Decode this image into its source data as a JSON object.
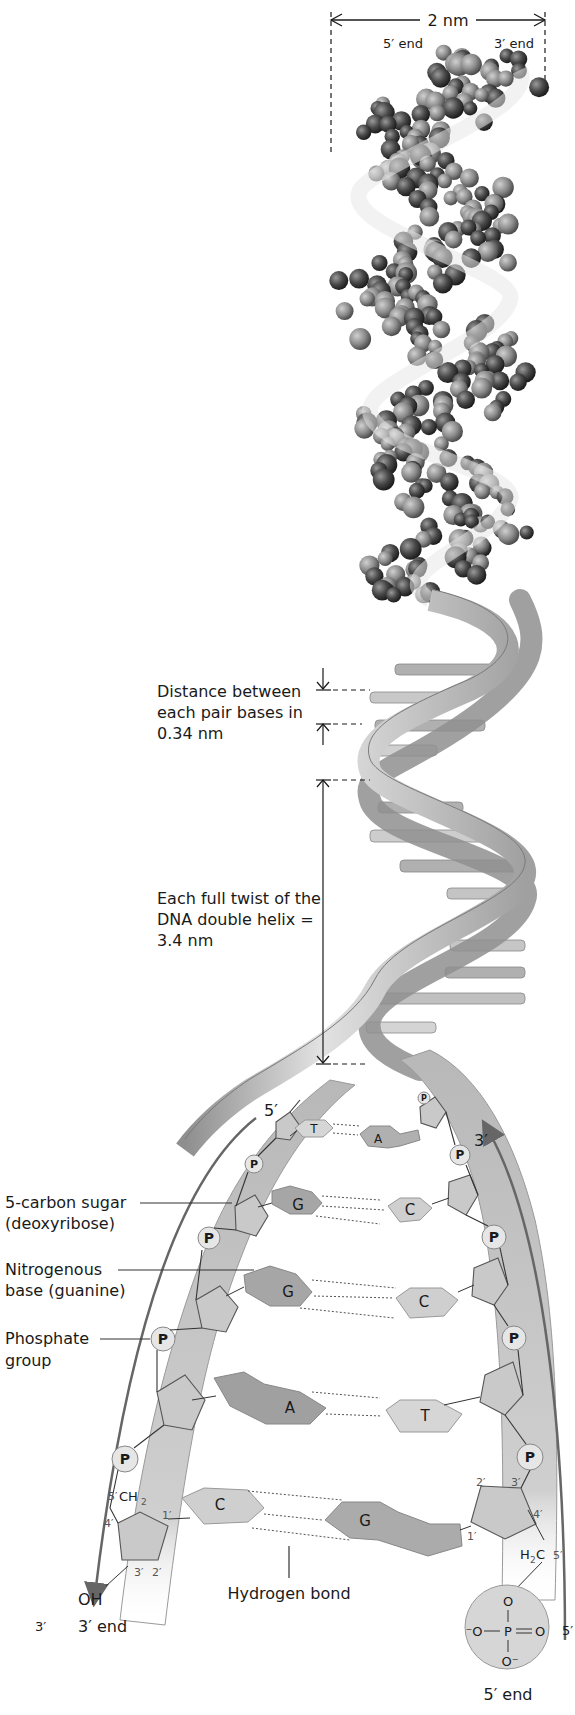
{
  "figure": {
    "width_label": "2 nm",
    "top_left_end": "5′ end",
    "top_right_end": "3′ end",
    "base_spacing": {
      "line1": "Distance between",
      "line2": "each pair bases in",
      "line3": "0.34 nm"
    },
    "full_twist": {
      "line1": "Each full twist of the",
      "line2": "DNA double helix =",
      "line3": "3.4 nm"
    },
    "strand_labels": {
      "left_top": "5′",
      "right_top": "3′",
      "left_bottom": "3′",
      "right_bottom": "5′",
      "left_end": "3′ end",
      "right_end": "5′ end"
    },
    "callouts": {
      "sugar_line1": "5-carbon sugar",
      "sugar_line2": "(deoxyribose)",
      "base_line1": "Nitrogenous",
      "base_line2": "base (guanine)",
      "phosphate_line1": "Phosphate",
      "phosphate_line2": "group",
      "hydrogen_bond": "Hydrogen bond"
    },
    "base_pairs": [
      {
        "left": "T",
        "right": "A"
      },
      {
        "left": "G",
        "right": "C"
      },
      {
        "left": "G",
        "right": "C"
      },
      {
        "left": "A",
        "right": "T"
      },
      {
        "left": "C",
        "right": "G"
      }
    ],
    "phosphate_symbol": "P",
    "chem": {
      "left_ch2": "CH",
      "left_ch2_sub": "2",
      "left_oh": "OH",
      "right_h2c_h": "H",
      "right_h2c_sub": "2",
      "right_h2c_c": "C",
      "primes": {
        "one": "1′",
        "two": "2′",
        "three": "3′",
        "four": "4′",
        "five": "5′"
      },
      "phosphate_O_top": "O",
      "phosphate_O_left": "⁻O",
      "phosphate_P": "P",
      "phosphate_O_right": "O",
      "phosphate_O_bottom": "O⁻"
    }
  },
  "colors": {
    "ink": "#1a1a1a",
    "ribbon_light": "#d9d9d9",
    "ribbon_dark": "#9a9a9a",
    "atom_dark": "#3a3a3a",
    "atom_mid": "#6e6e6e",
    "strand_fill": "#c4c4c4",
    "base_dark": "#a8a8a8",
    "base_light": "#d2d2d2"
  }
}
